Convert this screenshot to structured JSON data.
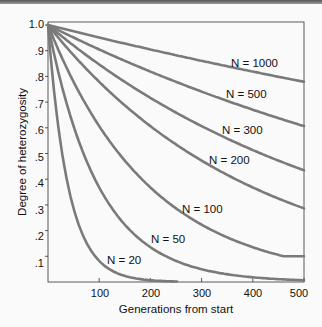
{
  "chart_data": {
    "type": "line",
    "title": "",
    "xlabel": "Generations from start",
    "ylabel": "Degree of heterozygosity",
    "xlim": [
      0,
      500
    ],
    "ylim": [
      0,
      1.0
    ],
    "grid": false,
    "legend": "inline labels",
    "x_ticks": [
      "100",
      "200",
      "300",
      "400",
      "500"
    ],
    "y_ticks": [
      ".1",
      ".2",
      ".3",
      ".4",
      ".5",
      ".6",
      ".7",
      ".8",
      ".9",
      "1.0"
    ],
    "x": [
      0,
      100,
      200,
      300,
      400,
      500
    ],
    "series": [
      {
        "name": "N = 1000",
        "N": 1000,
        "values": [
          1.0,
          0.95,
          0.9,
          0.86,
          0.82,
          0.78
        ]
      },
      {
        "name": "N = 500",
        "N": 500,
        "values": [
          1.0,
          0.9,
          0.82,
          0.74,
          0.67,
          0.61
        ]
      },
      {
        "name": "N = 300",
        "N": 300,
        "values": [
          1.0,
          0.85,
          0.72,
          0.61,
          0.51,
          0.43
        ]
      },
      {
        "name": "N = 200",
        "N": 200,
        "values": [
          1.0,
          0.78,
          0.61,
          0.47,
          0.37,
          0.29
        ]
      },
      {
        "name": "N = 100",
        "N": 100,
        "values": [
          1.0,
          0.61,
          0.37,
          0.22,
          0.14,
          0.1
        ]
      },
      {
        "name": "N = 50",
        "N": 50,
        "values": [
          1.0,
          0.37,
          0.14,
          0.05,
          0.02,
          0.01
        ]
      },
      {
        "name": "N = 20",
        "N": 20,
        "values": [
          1.0,
          0.08,
          0.01,
          0.0,
          0.0,
          0.0
        ]
      }
    ]
  },
  "labels": {
    "n1000": "N = 1000",
    "n500": "N = 500",
    "n300": "N = 300",
    "n200": "N = 200",
    "n100": "N = 100",
    "n50": "N = 50",
    "n20": "N = 20"
  },
  "colors": {
    "curve": "#7a7a7a",
    "axis": "#333333",
    "text": "#111111"
  }
}
